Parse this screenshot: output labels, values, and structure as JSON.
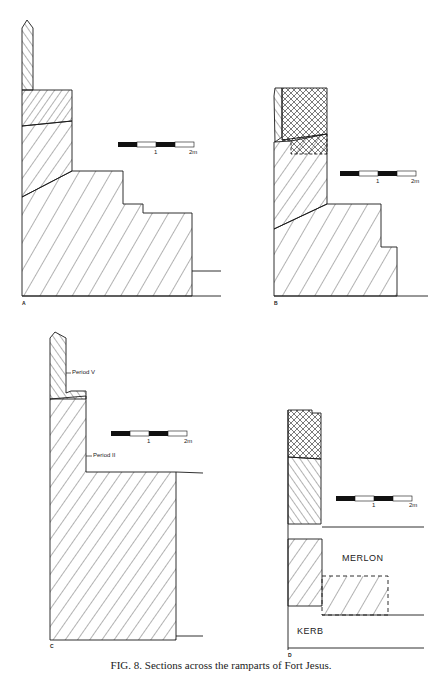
{
  "figure": {
    "caption_prefix": "FIG. 8.",
    "caption_text": "Sections across the ramparts of Fort Jesus."
  },
  "panels": [
    {
      "id": "A",
      "label": "A",
      "scale": {
        "tick_1": "1",
        "tick_2": "2m"
      }
    },
    {
      "id": "B",
      "label": "B",
      "scale": {
        "tick_1": "1",
        "tick_2": "2m"
      }
    },
    {
      "id": "C",
      "label": "C",
      "scale": {
        "tick_1": "1",
        "tick_2": "2m"
      },
      "annotations": [
        "Period V",
        "Period II"
      ]
    },
    {
      "id": "D",
      "label": "D",
      "scale": {
        "tick_1": "1",
        "tick_2": "2m"
      },
      "annotations": [
        "MERLON",
        "KERB"
      ]
    }
  ],
  "colors": {
    "ink": "#1a1a1a",
    "paper": "#ffffff"
  }
}
